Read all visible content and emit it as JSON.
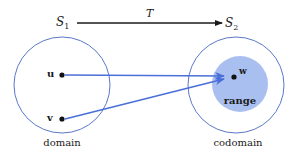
{
  "diagram": {
    "top_arrow": {
      "from_label": "S",
      "from_sub": "1",
      "to_label": "S",
      "to_sub": "2",
      "map_label": "T"
    },
    "domain": {
      "label": "domain",
      "points": [
        {
          "name": "u"
        },
        {
          "name": "v"
        }
      ]
    },
    "codomain": {
      "label": "codomain",
      "range_label": "range",
      "point": "w"
    },
    "colors": {
      "circle_stroke": "#5b78c8",
      "arrow": "#4a6fd8",
      "range_fill": "#a9bff0",
      "dot": "#111111",
      "top_arrow": "#1a1a1a"
    }
  }
}
